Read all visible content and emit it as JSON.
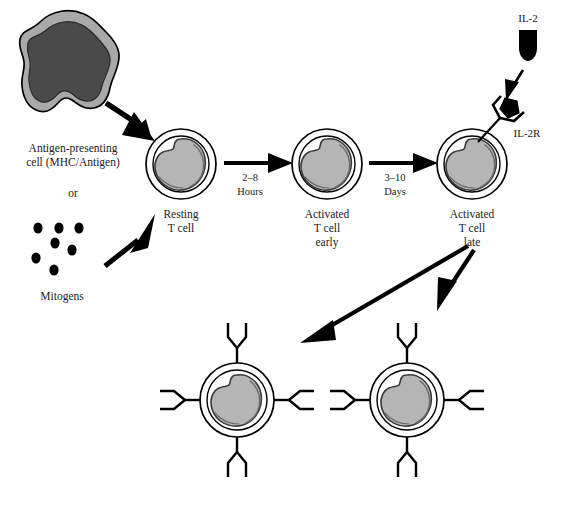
{
  "figure": {
    "background_color": "#ffffff",
    "width": 569,
    "height": 512
  },
  "colors": {
    "outline": "#000000",
    "cytoplasm_light_gray": "#a9a9a9",
    "nucleus_dark_gray": "#4a4a4a",
    "tcell_nucleus_gray": "#b5b5b5",
    "text": "#1a1a1a",
    "arrow_black": "#000000"
  },
  "labels": {
    "apc_line1": "Antigen-presenting",
    "apc_line2": "cell (MHC/Antigen)",
    "or": "or",
    "mitogens": "Mitogens",
    "resting_line1": "Resting",
    "resting_line2": "T cell",
    "activated_early_line1": "Activated",
    "activated_early_line2": "T cell",
    "activated_early_line3": "early",
    "activated_late_line1": "Activated",
    "activated_late_line2": "T cell",
    "activated_late_line3": "late",
    "il2": "IL-2",
    "il2r": "IL-2R",
    "time_1_line1": "2–8",
    "time_1_line2": "Hours",
    "time_2_line1": "3–10",
    "time_2_line2": "Days"
  },
  "cells": {
    "antigen_presenting_cell": {
      "name": "Antigen-presenting cell (MHC/Antigen)",
      "cx": 72,
      "cy": 62,
      "type": "amoeboid-blob"
    },
    "resting_t_cell": {
      "name": "Resting T cell",
      "cx": 181,
      "cy": 164,
      "r_outer": 35,
      "r_inner": 28
    },
    "activated_early_t_cell": {
      "name": "Activated T cell early",
      "cx": 327,
      "cy": 164,
      "r_outer": 35,
      "r_inner": 28
    },
    "activated_late_t_cell": {
      "name": "Activated T cell late",
      "cx": 472,
      "cy": 164,
      "r_outer": 35,
      "r_inner": 28
    },
    "daughter_cell_left": {
      "name": "Daughter T cell left",
      "cx": 237,
      "cy": 400,
      "r_outer": 37,
      "r_inner": 30,
      "receptors": 4
    },
    "daughter_cell_right": {
      "name": "Daughter T cell right",
      "cx": 407,
      "cy": 400,
      "r_outer": 37,
      "r_inner": 30,
      "receptors": 4
    }
  },
  "mitogen_dots": [
    {
      "cx": 38,
      "cy": 228
    },
    {
      "cx": 59,
      "cy": 228
    },
    {
      "cx": 79,
      "cy": 228
    },
    {
      "cx": 55,
      "cy": 243
    },
    {
      "cx": 72,
      "cy": 250
    },
    {
      "cx": 36,
      "cy": 258
    },
    {
      "cx": 54,
      "cy": 270
    }
  ],
  "arrows": [
    {
      "name": "apc-to-resting-tcell",
      "from": [
        108,
        107
      ],
      "to": [
        152,
        136
      ]
    },
    {
      "name": "mitogens-to-resting-tcell",
      "from": [
        107,
        263
      ],
      "to": [
        152,
        215
      ]
    },
    {
      "name": "resting-to-activated-early",
      "from": [
        222,
        163
      ],
      "to": [
        292,
        163
      ],
      "label": "2–8 Hours"
    },
    {
      "name": "activated-early-to-late",
      "from": [
        367,
        163
      ],
      "to": [
        437,
        163
      ],
      "label": "3–10 Days"
    },
    {
      "name": "il2-to-il2r",
      "from": [
        521,
        75
      ],
      "to": [
        507,
        99
      ]
    },
    {
      "name": "late-tcell-to-daughter-left",
      "from": [
        466,
        245
      ],
      "to": [
        305,
        340
      ]
    },
    {
      "name": "late-tcell-to-daughter-right",
      "from": [
        472,
        248
      ],
      "to": [
        440,
        300
      ]
    }
  ],
  "ligands": {
    "il2_capsule": {
      "name": "IL-2 cytokine",
      "x": 524,
      "y": 36,
      "shape": "capsule"
    },
    "il2r_receptor": {
      "name": "IL-2 receptor",
      "x": 500,
      "y": 115,
      "shape": "y-receptor-with-pentagon-ligand"
    }
  }
}
